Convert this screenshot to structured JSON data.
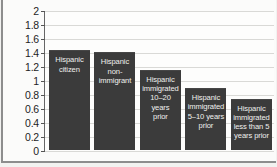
{
  "chart_data": {
    "type": "bar",
    "title": "",
    "subtitle": "",
    "xlabel": "",
    "ylabel": "",
    "ylim": [
      0,
      2
    ],
    "yticks": [
      "0",
      "0.2",
      "0.4",
      "0.6",
      "0.8",
      "1",
      "1.2",
      "1.4",
      "1.6",
      "1.8",
      "2"
    ],
    "ytick_values": [
      0,
      0.2,
      0.4,
      0.6,
      0.8,
      1.0,
      1.2,
      1.4,
      1.6,
      1.8,
      2.0
    ],
    "grid": true,
    "legend": "none",
    "bar_color": "#3b3b3b",
    "label_color": "#f0f0ee",
    "categories": [
      "Hispanic citizen",
      "Hispanic non-immigrant",
      "Hispanic immigrated 10–20 years prior",
      "Hispanic immigrated 5–10 years prior",
      "Hispanic immigrated less than 5 years prior"
    ],
    "values": [
      1.44,
      1.41,
      1.16,
      0.9,
      0.75
    ],
    "bars": [
      {
        "label_lines": [
          "Hispanic",
          "citizen"
        ],
        "value": 1.44
      },
      {
        "label_lines": [
          "Hispanic",
          "non-",
          "immigrant"
        ],
        "value": 1.41
      },
      {
        "label_lines": [
          "Hispanic",
          "immigrated",
          "10–20 years",
          "prior"
        ],
        "value": 1.16
      },
      {
        "label_lines": [
          "Hispanic",
          "immigrated",
          "5–10 years",
          "prior"
        ],
        "value": 0.9
      },
      {
        "label_lines": [
          "Hispanic",
          "immigrated",
          "less than 5",
          "years prior"
        ],
        "value": 0.75
      }
    ]
  }
}
